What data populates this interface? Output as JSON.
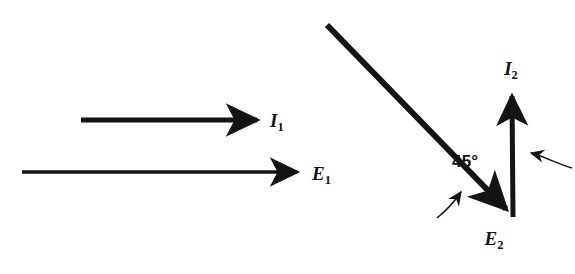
{
  "figure": {
    "background_color": "#ffffff",
    "stroke_color": "#141414",
    "width": 575,
    "height": 274
  },
  "left_diagram": {
    "name": "in-phase-phasors",
    "vectors": [
      {
        "id": "I1",
        "label_base": "I",
        "label_sub": "1",
        "label_text": "I₁",
        "direction_deg": 0,
        "x1": 81,
        "y1": 120,
        "x2": 263,
        "y2": 120,
        "thickness": 5.2,
        "label_x": 270,
        "label_y": 127
      },
      {
        "id": "E1",
        "label_base": "E",
        "label_sub": "1",
        "label_text": "E₁",
        "direction_deg": 0,
        "x1": 22,
        "y1": 172,
        "x2": 305,
        "y2": 172,
        "thickness": 3.4,
        "label_x": 312,
        "label_y": 180
      }
    ]
  },
  "right_diagram": {
    "name": "lagging-phasors",
    "vertex": {
      "x": 513,
      "y": 216
    },
    "vectors": [
      {
        "id": "E2",
        "label_base": "E",
        "label_sub": "2",
        "label_text": "E₂",
        "direction_deg": -45,
        "x1": 327,
        "y1": 25,
        "x2": 513,
        "y2": 216,
        "thickness": 6.0,
        "label_x": 494,
        "label_y": 245
      },
      {
        "id": "I2",
        "label_base": "I",
        "label_sub": "2",
        "label_text": "I₂",
        "direction_deg": 90,
        "x1": 513,
        "y1": 216,
        "x2": 512,
        "y2": 88,
        "thickness": 5.0,
        "label_x": 511,
        "label_y": 75
      }
    ],
    "angle_annotation": {
      "text": "45°",
      "value": 45,
      "unit": "degrees",
      "x": 452,
      "y": 167
    },
    "leader_arrows": [
      {
        "id": "leader-to-E2-line",
        "points_at": "E2",
        "tail_x": 437,
        "tail_y": 218,
        "tip_x": 472,
        "tip_y": 184
      },
      {
        "id": "leader-to-I2-line",
        "points_at": "I2",
        "tail_x": 572,
        "tail_y": 168,
        "tip_x": 521,
        "tip_y": 152
      }
    ]
  }
}
